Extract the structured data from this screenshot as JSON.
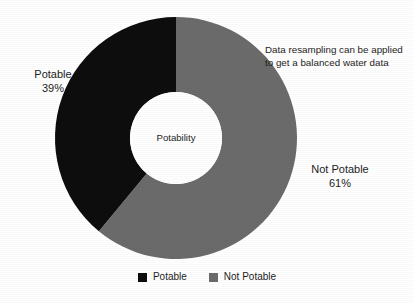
{
  "figure": {
    "background_color": "#ffffff",
    "center_label": "Potability",
    "annotation": {
      "line1": "Data resampling can be applied",
      "line2": "to get a balanced water data"
    },
    "slice_labels": {
      "left": {
        "name": "Potable",
        "percent": "39%"
      },
      "right": {
        "name": "Not Potable",
        "percent": "61%"
      }
    }
  },
  "legend": {
    "position": "bottom-center",
    "items": [
      {
        "label": "Potable",
        "color": "#0d0d0d"
      },
      {
        "label": "Not Potable",
        "color": "#6b6b6b"
      }
    ]
  },
  "chart_data": {
    "type": "pie",
    "variant": "donut",
    "title": "",
    "center_text": "Potability",
    "categories": [
      "Not Potable",
      "Potable"
    ],
    "values": [
      61,
      39
    ],
    "unit": "%",
    "labels": [
      "Not Potable\n61%",
      "Potable\n39%"
    ],
    "colors": [
      "#6b6b6b",
      "#0d0d0d"
    ],
    "start_angle_deg": 0,
    "direction": "clockwise",
    "inner_radius_ratio": 0.38,
    "legend": [
      "Potable",
      "Not Potable"
    ],
    "annotations": [
      "Data resampling can be applied to get a balanced water data"
    ],
    "geometry": {
      "center_x": 176,
      "center_y": 138,
      "outer_radius": 121,
      "inner_radius": 46
    }
  }
}
